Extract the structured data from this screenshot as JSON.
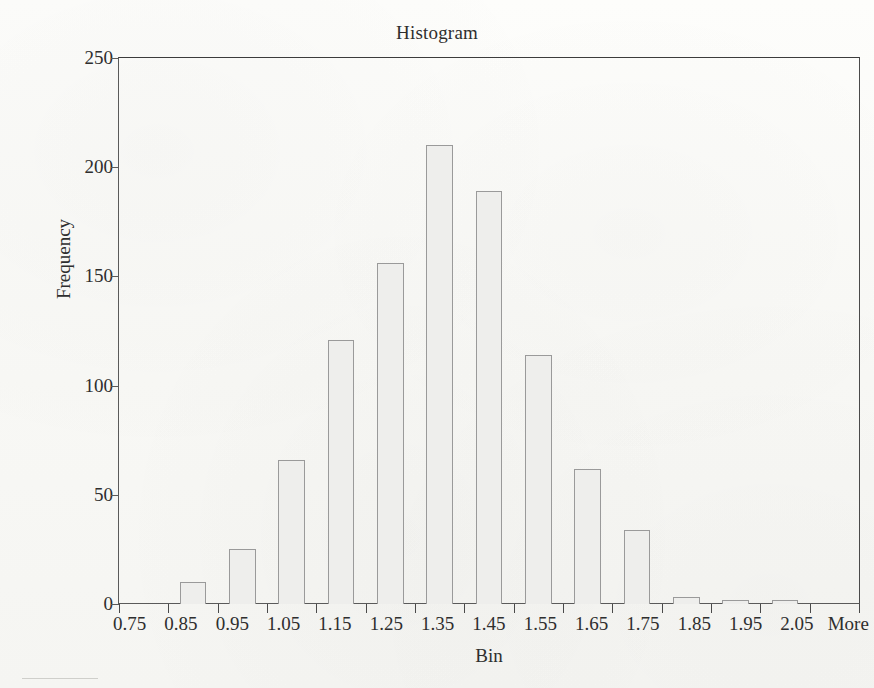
{
  "chart_data": {
    "type": "bar",
    "title": "Histogram",
    "xlabel": "Bin",
    "ylabel": "Frequency",
    "categories": [
      "0.75",
      "0.85",
      "0.95",
      "1.05",
      "1.15",
      "1.25",
      "1.35",
      "1.45",
      "1.55",
      "1.65",
      "1.75",
      "1.85",
      "1.95",
      "2.05",
      "More"
    ],
    "values": [
      0,
      10,
      25,
      66,
      121,
      156,
      210,
      189,
      114,
      62,
      34,
      3,
      1,
      2,
      0
    ],
    "series": [
      {
        "name": "Frequency",
        "values": [
          0,
          10,
          25,
          66,
          121,
          156,
          210,
          189,
          114,
          62,
          34,
          3,
          1,
          2,
          0
        ]
      }
    ],
    "ylim": [
      0,
      250
    ],
    "ytick_labels": [
      "0",
      "50",
      "100",
      "150",
      "200",
      "250"
    ],
    "ytick_values": [
      0,
      50,
      100,
      150,
      200,
      250
    ],
    "grid": false,
    "legend": false,
    "legend_position": "none",
    "bar_fill_color": "#eeeeec",
    "bar_border_color": "#9a9a9a",
    "axis_color": "#5a5a5a",
    "background_color": "#fbfbf9"
  }
}
